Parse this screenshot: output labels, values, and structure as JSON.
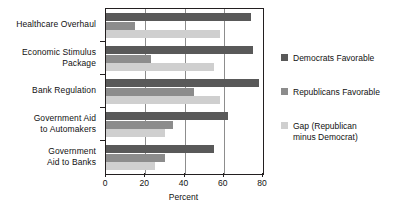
{
  "chart_data": {
    "type": "bar",
    "orientation": "horizontal",
    "title": "",
    "xlabel": "Percent",
    "ylabel": "",
    "xlim": [
      0,
      80
    ],
    "xticks": [
      0,
      20,
      40,
      60,
      80
    ],
    "xtick_labels": [
      "0",
      "20",
      "40",
      "60",
      "80"
    ],
    "grid": "vertical",
    "legend_position": "right",
    "categories": [
      "Healthcare Overhaul",
      "Economic Stimulus Package",
      "Bank Regulation",
      "Government Aid to Automakers",
      "Government Aid to Banks"
    ],
    "category_lines": [
      [
        "Healthcare Overhaul"
      ],
      [
        "Economic Stimulus",
        "Package"
      ],
      [
        "Bank Regulation"
      ],
      [
        "Government Aid",
        "to Automakers"
      ],
      [
        "Government",
        "Aid to Banks"
      ]
    ],
    "series": [
      {
        "name": "Democrats Favorable",
        "color": "#595959",
        "values": [
          74,
          75,
          78,
          62,
          55
        ]
      },
      {
        "name": "Republicans Favorable",
        "color": "#8c8c8c",
        "values": [
          15,
          23,
          45,
          34,
          30
        ]
      },
      {
        "name": "Gap (Republican minus Democrat)",
        "color": "#cfcfcf",
        "values": [
          58,
          55,
          58,
          30,
          25
        ]
      }
    ],
    "legend_entries": [
      {
        "label": "Democrats Favorable",
        "lines": [
          "Democrats Favorable"
        ],
        "color": "#595959"
      },
      {
        "label": "Republicans Favorable",
        "lines": [
          "Republicans Favorable"
        ],
        "color": "#8c8c8c"
      },
      {
        "label": "Gap (Republican minus Democrat)",
        "lines": [
          "Gap (Republican",
          "minus Democrat)"
        ],
        "color": "#cfcfcf"
      }
    ]
  },
  "axis": {
    "x_title": "Percent"
  },
  "colors": {
    "democrat": "#595959",
    "republican": "#8c8c8c",
    "gap": "#cfcfcf",
    "axis": "#231f20",
    "grid": "#8d8d8d",
    "background": "#ffffff"
  }
}
